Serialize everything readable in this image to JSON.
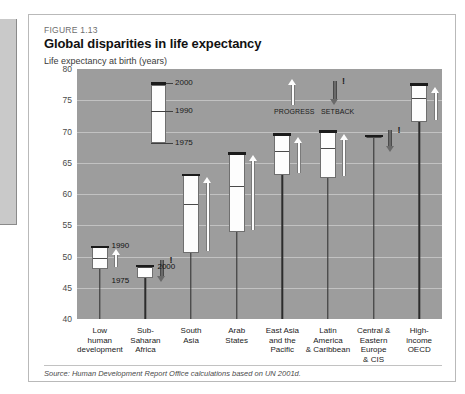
{
  "figure": {
    "number": "FIGURE 1.13",
    "title": "Global disparities in life expectancy",
    "axis_title": "Life expectancy at birth (years)",
    "source": "Source: Human Development Report Office calculations based on UN 2001d."
  },
  "legend": {
    "top_label": "2000",
    "mid_label": "1990",
    "bottom_label": "1975"
  },
  "key": {
    "progress": "PROGRESS",
    "setback": "SETBACK",
    "bang": "!"
  },
  "chart_data": {
    "type": "bar",
    "title": "Global disparities in life expectancy",
    "subtitle": "FIGURE 1.13",
    "xlabel": "",
    "ylabel": "Life expectancy at birth (years)",
    "ylim": [
      40,
      80
    ],
    "yticks": [
      80,
      75,
      70,
      65,
      60,
      55,
      50,
      45,
      40
    ],
    "grid": true,
    "legend_position": "inside-top-left",
    "series": [
      {
        "name": "1975",
        "values": [
          48.0,
          46.5,
          50.5,
          54.0,
          63.0,
          62.5,
          69.0,
          71.5
        ]
      },
      {
        "name": "1990",
        "values": [
          50.0,
          50.0,
          58.5,
          61.5,
          67.0,
          67.5,
          69.8,
          75.5
        ]
      },
      {
        "name": "2000",
        "values": [
          51.5,
          48.5,
          63.0,
          66.5,
          69.5,
          70.0,
          69.3,
          77.5
        ]
      }
    ],
    "categories": [
      "Low human development",
      "Sub-Saharan Africa",
      "South Asia",
      "Arab States",
      "East Asia and the Pacific",
      "Latin America & Caribbean",
      "Central & Eastern Europe & CIS",
      "High-income OECD"
    ],
    "trend": [
      "progress",
      "setback",
      "progress",
      "progress",
      "progress",
      "progress",
      "setback",
      "progress"
    ],
    "annotations": [
      "PROGRESS",
      "SETBACK",
      "1975",
      "1990",
      "2000"
    ]
  },
  "categories_display": [
    {
      "lines": [
        "Low",
        "human",
        "development"
      ]
    },
    {
      "lines": [
        "Sub-Saharan",
        "Africa"
      ]
    },
    {
      "lines": [
        "South",
        "Asia"
      ]
    },
    {
      "lines": [
        "Arab",
        "States"
      ]
    },
    {
      "lines": [
        "East Asia",
        "and the",
        "Pacific"
      ]
    },
    {
      "lines": [
        "Latin",
        "America",
        "& Caribbean"
      ]
    },
    {
      "lines": [
        "Central &",
        "Eastern",
        "Europe",
        "& CIS"
      ]
    },
    {
      "lines": [
        "High-",
        "income",
        "OECD"
      ]
    }
  ],
  "inline_labels": {
    "ssa_1990": "1990",
    "ssa_2000": "2000",
    "ssa_1975": "1975",
    "ssa_bang": "!"
  },
  "colors": {
    "plot_background": "#9d9d9d",
    "bar_fill": "#fdfdfd",
    "bar_outline": "#6f6f6f",
    "cap": "#1b1b1b",
    "gridline": "#cfcfcf",
    "setback_arrow": "#6a6a6a"
  }
}
